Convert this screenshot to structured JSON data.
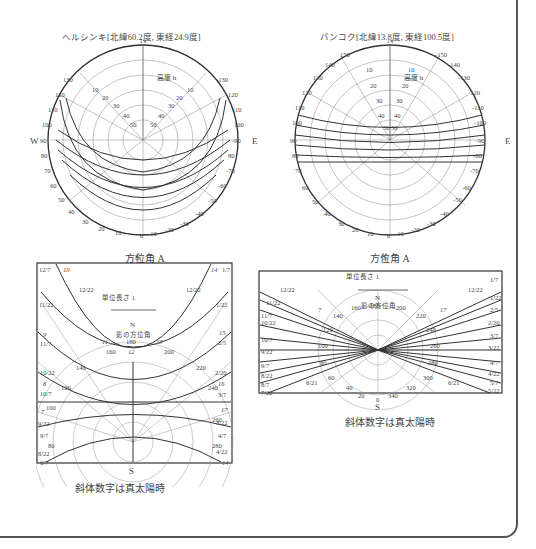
{
  "figure": {
    "helsinki": {
      "title": "ヘルシンキ[北緯60.2度, 東経24.9度]",
      "north": "N",
      "south": "S",
      "west": "W",
      "east": "E",
      "altitude_label": "高度 h",
      "azimuth_caption": "方位角 A",
      "azimuth_ticks_left": [
        "130",
        "120",
        "110",
        "100",
        "90",
        "80",
        "70",
        "60",
        "50",
        "40",
        "30",
        "20",
        "10",
        "0"
      ],
      "azimuth_ticks_right": [
        "-130",
        "120",
        "110",
        "100",
        "-90",
        "80",
        "-70",
        "-60",
        "-50",
        "-40",
        "-30",
        "-20",
        "-10"
      ],
      "altitude_ticks": [
        "10",
        "20",
        "30",
        "40",
        "50"
      ]
    },
    "bangkok": {
      "title": "バンコク[北緯13.8度, 東経100.5度]",
      "north": "N",
      "south": "S",
      "west": "W",
      "east": "E",
      "altitude_label": "高度 h",
      "azimuth_caption": "方位角 A",
      "azimuth_ticks_left": [
        "150",
        "140",
        "130",
        "120",
        "110",
        "100",
        "90",
        "80",
        "70",
        "60",
        "50",
        "40",
        "30",
        "20",
        "10",
        "0"
      ],
      "azimuth_ticks_right": [
        "-150",
        "-140",
        "-130",
        "-120",
        "-110",
        "-100",
        "-90",
        "-80",
        "-70",
        "-60",
        "-50",
        "-40",
        "-30",
        "-20",
        "-10"
      ],
      "altitude_ticks": [
        "10",
        "20",
        "30",
        "40",
        "50"
      ]
    },
    "helsinki_shadow": {
      "unit_length": "単位長さ 1",
      "north": "N",
      "shadow_azimuth": "影の方位角",
      "south": "S",
      "caption": "斜体数字は真太陽時",
      "date_labels_left": [
        "12/7",
        "12/22",
        "11/22",
        "9",
        "11/7",
        "10/22",
        "8",
        "10/7",
        "7",
        "9/22",
        "9/7",
        "8/22",
        "6/7"
      ],
      "date_labels_right": [
        "1/7",
        "12/22",
        "1/22",
        "15",
        "2/5",
        "2/20",
        "16",
        "3/7",
        "17",
        "3/22",
        "4/7",
        "4/22",
        "14"
      ],
      "hour_labels": [
        "10",
        "11",
        "12",
        "13",
        "14"
      ],
      "azimuth_labels": [
        "160",
        "180",
        "200",
        "140",
        "220",
        "120",
        "240",
        "100",
        "260",
        "80",
        "280"
      ]
    },
    "bangkok_shadow": {
      "unit_length": "単位長さ 1",
      "north": "N",
      "shadow_azimuth": "影の方位角",
      "south": "S",
      "caption": "斜体数字は真太陽時",
      "date_labels_left": [
        "12/22",
        "11/22",
        "11/7",
        "10/22",
        "10/7",
        "9/22",
        "9/7",
        "8/22",
        "8/7",
        "7/22",
        "6/21"
      ],
      "date_labels_right": [
        "1/7",
        "1/22",
        "2/5",
        "2/20",
        "3/7",
        "3/22",
        "4/7",
        "4/22",
        "5/7",
        "5/22",
        "6/21"
      ],
      "hour_labels": [
        "7",
        "17"
      ],
      "azimuth_labels": [
        "140",
        "160",
        "180",
        "200",
        "220",
        "120",
        "240",
        "100",
        "260",
        "80",
        "280",
        "60",
        "300",
        "40",
        "320",
        "20",
        "340",
        "0"
      ]
    }
  }
}
